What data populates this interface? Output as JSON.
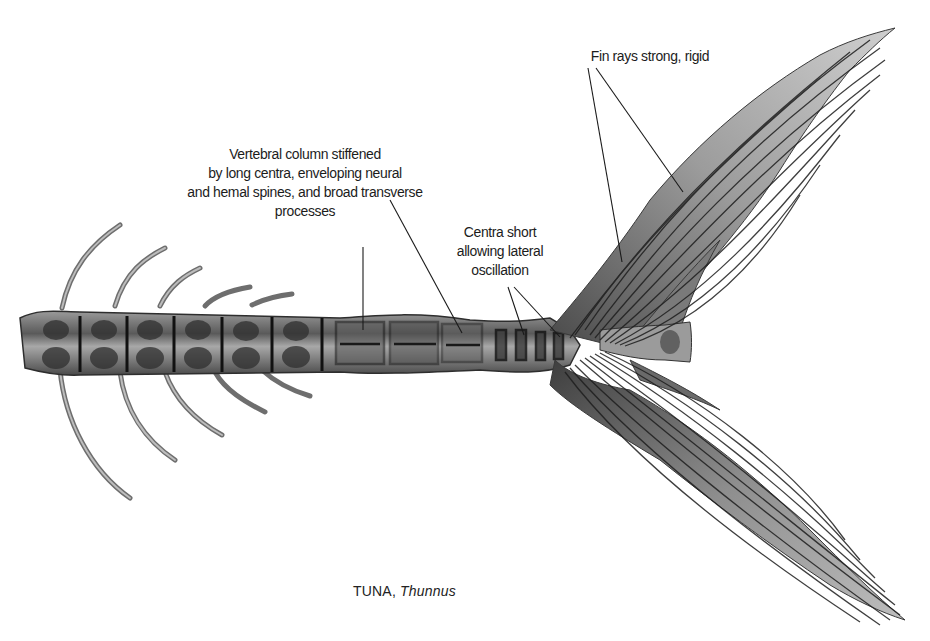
{
  "figure": {
    "caption": {
      "common_name": "TUNA,",
      "genus": "Thunnus"
    }
  },
  "annotations": [
    {
      "id": "vertebral-column",
      "lines": [
        "Vertebral column stiffened",
        "by long centra, enveloping neural",
        "and hemal spines, and broad transverse",
        "processes"
      ]
    },
    {
      "id": "centra-short",
      "lines": [
        "Centra short",
        "allowing lateral",
        "oscillation"
      ]
    },
    {
      "id": "fin-rays",
      "lines": [
        "Fin rays strong, rigid"
      ]
    }
  ],
  "colors": {
    "background": "#ffffff",
    "bone_dark": "#3a3a3a",
    "bone_mid": "#7d7d7d",
    "bone_light": "#b8b8b8",
    "text": "#1c1c1c"
  }
}
